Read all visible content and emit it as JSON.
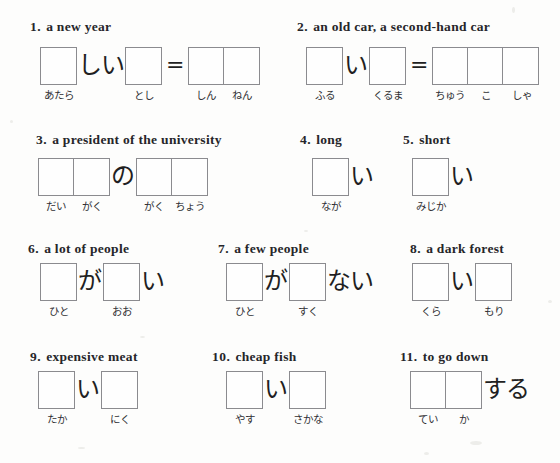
{
  "worksheet": {
    "background_color": "#fdfdfc",
    "ink_color": "#26262a",
    "box_border_color": "#8b8b8f",
    "equals_sign": "=",
    "items": [
      {
        "number": "1",
        "prompt": "a new year",
        "segments": [
          {
            "type": "box",
            "cells": 1,
            "hints": [
              "あたら"
            ]
          },
          {
            "type": "kana",
            "text": "しい"
          },
          {
            "type": "box",
            "cells": 1,
            "hints": [
              "とし"
            ]
          },
          {
            "type": "equals",
            "text": "="
          },
          {
            "type": "box",
            "cells": 2,
            "hints": [
              "しん",
              "ねん"
            ]
          }
        ]
      },
      {
        "number": "2",
        "prompt": "an old car, a second-hand car",
        "segments": [
          {
            "type": "box",
            "cells": 1,
            "hints": [
              "ふる"
            ]
          },
          {
            "type": "kana",
            "text": "い"
          },
          {
            "type": "box",
            "cells": 1,
            "hints": [
              "くるま"
            ]
          },
          {
            "type": "equals",
            "text": "="
          },
          {
            "type": "box",
            "cells": 3,
            "hints": [
              "ちゅう",
              "こ",
              "しゃ"
            ]
          }
        ]
      },
      {
        "number": "3",
        "prompt": "a president of the university",
        "segments": [
          {
            "type": "box",
            "cells": 2,
            "hints": [
              "だい",
              "がく"
            ]
          },
          {
            "type": "kana",
            "text": "の"
          },
          {
            "type": "box",
            "cells": 2,
            "hints": [
              "がく",
              "ちょう"
            ]
          }
        ]
      },
      {
        "number": "4",
        "prompt": "long",
        "segments": [
          {
            "type": "box",
            "cells": 1,
            "hints": [
              "なが"
            ]
          },
          {
            "type": "kana",
            "text": "い"
          }
        ]
      },
      {
        "number": "5",
        "prompt": "short",
        "segments": [
          {
            "type": "box",
            "cells": 1,
            "hints": [
              "みじか"
            ]
          },
          {
            "type": "kana",
            "text": "い"
          }
        ]
      },
      {
        "number": "6",
        "prompt": "a lot of people",
        "segments": [
          {
            "type": "box",
            "cells": 1,
            "hints": [
              "ひと"
            ]
          },
          {
            "type": "kana",
            "text": "が"
          },
          {
            "type": "box",
            "cells": 1,
            "hints": [
              "おお"
            ]
          },
          {
            "type": "kana",
            "text": "い"
          }
        ]
      },
      {
        "number": "7",
        "prompt": "a few people",
        "segments": [
          {
            "type": "box",
            "cells": 1,
            "hints": [
              "ひと"
            ]
          },
          {
            "type": "kana",
            "text": "が"
          },
          {
            "type": "box",
            "cells": 1,
            "hints": [
              "すく"
            ]
          },
          {
            "type": "kana",
            "text": "ない"
          }
        ]
      },
      {
        "number": "8",
        "prompt": "a dark forest",
        "segments": [
          {
            "type": "box",
            "cells": 1,
            "hints": [
              "くら"
            ]
          },
          {
            "type": "kana",
            "text": "い"
          },
          {
            "type": "box",
            "cells": 1,
            "hints": [
              "もり"
            ]
          }
        ]
      },
      {
        "number": "9",
        "prompt": "expensive meat",
        "segments": [
          {
            "type": "box",
            "cells": 1,
            "hints": [
              "たか"
            ]
          },
          {
            "type": "kana",
            "text": "い"
          },
          {
            "type": "box",
            "cells": 1,
            "hints": [
              "にく"
            ]
          }
        ]
      },
      {
        "number": "10",
        "prompt": "cheap fish",
        "segments": [
          {
            "type": "box",
            "cells": 1,
            "hints": [
              "やす"
            ]
          },
          {
            "type": "kana",
            "text": "い"
          },
          {
            "type": "box",
            "cells": 1,
            "hints": [
              "さかな"
            ]
          }
        ]
      },
      {
        "number": "11",
        "prompt": "to go down",
        "segments": [
          {
            "type": "box",
            "cells": 2,
            "hints": [
              "てい",
              "か"
            ]
          },
          {
            "type": "kana",
            "text": "する"
          }
        ]
      }
    ]
  },
  "layout": {
    "items": [
      {
        "heading_left": 30,
        "heading_top": 19,
        "row_left": 40,
        "row_top": 47
      },
      {
        "heading_left": 297,
        "heading_top": 19,
        "row_left": 306,
        "row_top": 47
      },
      {
        "heading_left": 36,
        "heading_top": 132,
        "row_left": 38,
        "row_top": 158
      },
      {
        "heading_left": 300,
        "heading_top": 132,
        "row_left": 312,
        "row_top": 158
      },
      {
        "heading_left": 403,
        "heading_top": 132,
        "row_left": 412,
        "row_top": 158
      },
      {
        "heading_left": 28,
        "heading_top": 241,
        "row_left": 40,
        "row_top": 263
      },
      {
        "heading_left": 218,
        "heading_top": 241,
        "row_left": 226,
        "row_top": 263
      },
      {
        "heading_left": 410,
        "heading_top": 241,
        "row_left": 412,
        "row_top": 263
      },
      {
        "heading_left": 30,
        "heading_top": 349,
        "row_left": 38,
        "row_top": 371
      },
      {
        "heading_left": 212,
        "heading_top": 349,
        "row_left": 226,
        "row_top": 371
      },
      {
        "heading_left": 400,
        "heading_top": 349,
        "row_left": 410,
        "row_top": 371
      }
    ]
  }
}
